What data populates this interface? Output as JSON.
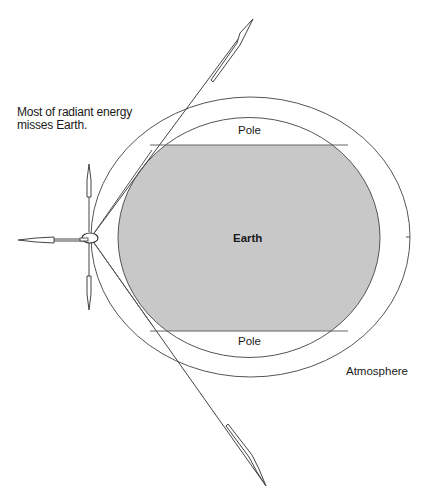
{
  "diagram": {
    "note": "Most of radiant energy\nmisses Earth.",
    "note_line1": "Most of radiant energy",
    "note_line2": "misses Earth.",
    "labels": {
      "earth": "Earth",
      "pole_top": "Pole",
      "pole_bottom": "Pole",
      "atmosphere": "Atmosphere"
    },
    "colors": {
      "earth_fill": "#c8c8c8",
      "stroke": "#555555",
      "background": "#ffffff"
    },
    "elements": {
      "source": "satellite (small ellipse) at left edge of atmosphere",
      "rays": [
        "left horizontal arrow",
        "up arrow",
        "down arrow",
        "upper tangent ray with arrow",
        "lower tangent ray with arrow"
      ]
    }
  }
}
